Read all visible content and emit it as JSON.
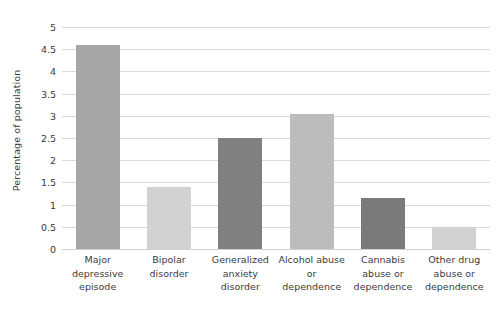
{
  "chart_data": {
    "type": "bar",
    "title": "",
    "xlabel": "",
    "ylabel": "Percentage of population",
    "ylim": [
      0,
      5
    ],
    "ytick_step": 0.5,
    "ytick_labels": [
      "0",
      "0.5",
      "1",
      "1.5",
      "2",
      "2.5",
      "3",
      "3.5",
      "4",
      "4.5",
      "5"
    ],
    "ytick_values": [
      0,
      0.5,
      1,
      1.5,
      2,
      2.5,
      3,
      3.5,
      4,
      4.5,
      5
    ],
    "grid": true,
    "legend": "none",
    "categories": [
      "Major depressive episode",
      "Bipolar disorder",
      "Generalized anxiety disorder",
      "Alcohol abuse or dependence",
      "Cannabis abuse or dependence",
      "Other drug abuse or dependence"
    ],
    "category_lines": [
      [
        "Major",
        "depressive",
        "episode"
      ],
      [
        "Bipolar",
        "disorder"
      ],
      [
        "Generalized",
        "anxiety",
        "disorder"
      ],
      [
        "Alcohol abuse",
        "or",
        "dependence"
      ],
      [
        "Cannabis",
        "abuse or",
        "dependence"
      ],
      [
        "Other drug",
        "abuse or",
        "dependence"
      ]
    ],
    "values": [
      4.6,
      1.4,
      2.5,
      3.05,
      1.15,
      0.5
    ],
    "bar_colors": [
      "#a6a6a6",
      "#d2d2d2",
      "#808080",
      "#bcbcbc",
      "#7a7a7a",
      "#d2d2d2"
    ]
  },
  "style": {
    "grid_color": "#d9d9d9",
    "axis_text_color": "#3b3b3b",
    "background": "#ffffff"
  }
}
